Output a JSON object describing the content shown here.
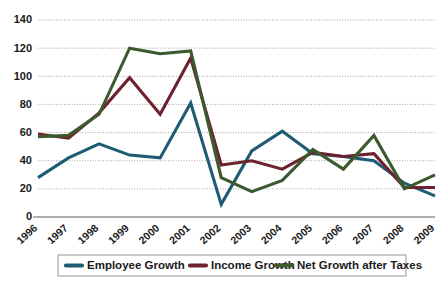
{
  "chart_data": {
    "type": "line",
    "title": "",
    "subtitle": "",
    "xlabel": "",
    "ylabel": "",
    "ylim": [
      0,
      140
    ],
    "yticks": [
      0,
      20,
      40,
      60,
      80,
      100,
      120,
      140
    ],
    "grid": true,
    "legend_position": "bottom",
    "categories": [
      "1996",
      "1997",
      "1998",
      "1999",
      "2000",
      "2001",
      "2002",
      "2003",
      "2004",
      "2005",
      "2006",
      "2007",
      "2008",
      "2009"
    ],
    "x": [
      "1996",
      "1997",
      "1998",
      "1999",
      "2000",
      "2001",
      "2002",
      "2003",
      "2004",
      "2005",
      "2006",
      "2007",
      "2008",
      "2009"
    ],
    "series": [
      {
        "name": "Employee Growth",
        "color": "#1f5c73",
        "values": [
          28,
          42,
          52,
          44,
          42,
          81,
          9,
          47,
          61,
          45,
          43,
          40,
          24,
          15
        ]
      },
      {
        "name": "Income Growth",
        "color": "#6e2230",
        "values": [
          59,
          56,
          74,
          99,
          73,
          113,
          37,
          40,
          34,
          46,
          43,
          45,
          21,
          21
        ]
      },
      {
        "name": "Net Growth after Taxes",
        "color": "#3d5a2e",
        "values": [
          57,
          58,
          73,
          120,
          116,
          118,
          28,
          18,
          26,
          48,
          34,
          58,
          20,
          30
        ]
      }
    ]
  },
  "legend": {
    "items": [
      {
        "label": "Employee Growth",
        "color": "#1f5c73"
      },
      {
        "label": "Income Growth",
        "color": "#6e2230"
      },
      {
        "label": "Net Growth after Taxes",
        "color": "#3d5a2e"
      }
    ]
  },
  "axes": {
    "y_tick_labels": [
      "0",
      "20",
      "40",
      "60",
      "80",
      "100",
      "120",
      "140"
    ],
    "x_tick_labels": [
      "1996",
      "1997",
      "1998",
      "1999",
      "2000",
      "2001",
      "2002",
      "2003",
      "2004",
      "2005",
      "2006",
      "2007",
      "2008",
      "2009"
    ]
  },
  "colors": {
    "background": "#ffffff",
    "grid": "#9a9a9a",
    "axis": "#6d6d6d",
    "text": "#1a1a1a",
    "employee_growth": "#1f5c73",
    "income_growth": "#6e2230",
    "net_growth": "#3d5a2e"
  }
}
